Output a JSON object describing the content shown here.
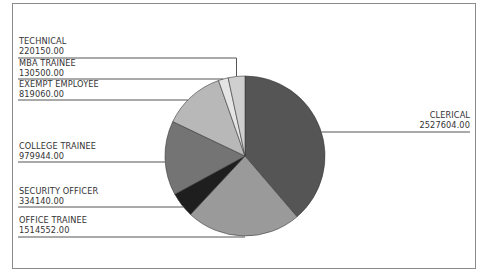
{
  "chart_data": {
    "type": "pie",
    "title": "",
    "start_angle_deg": 0,
    "direction": "clockwise",
    "slices": [
      {
        "label": "CLERICAL",
        "value": 2527604.0,
        "display": "2527604.00",
        "color": "#555555",
        "side": "right"
      },
      {
        "label": "OFFICE TRAINEE",
        "value": 1514552.0,
        "display": "1514552.00",
        "color": "#9a9a9a",
        "side": "left"
      },
      {
        "label": "SECURITY OFFICER",
        "value": 334140.0,
        "display": "334140.00",
        "color": "#1e1e1e",
        "side": "left"
      },
      {
        "label": "COLLEGE TRAINEE",
        "value": 979944.0,
        "display": "979944.00",
        "color": "#747474",
        "side": "left"
      },
      {
        "label": "EXEMPT EMPLOYEE",
        "value": 819060.0,
        "display": "819060.00",
        "color": "#b8b8b8",
        "side": "left"
      },
      {
        "label": "MBA TRAINEE",
        "value": 130500.0,
        "display": "130500.00",
        "color": "#e4e4e4",
        "side": "left"
      },
      {
        "label": "TECHNICAL",
        "value": 220150.0,
        "display": "220150.00",
        "color": "#cfcfcf",
        "side": "left"
      }
    ],
    "legend": "leader-line labels"
  }
}
